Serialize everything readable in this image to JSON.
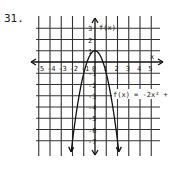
{
  "problem_number": "31.",
  "chart_data": {
    "type": "line",
    "title": "",
    "function_label": "f(x) = -2x² + 1",
    "xlabel": "x",
    "ylabel": "f(x)",
    "xlim": [
      -5,
      5
    ],
    "ylim": [
      -7,
      3
    ],
    "grid": true,
    "x_ticks": [
      "-5",
      "-4",
      "-3",
      "-2",
      "-1",
      "0",
      "1",
      "2",
      "3",
      "4",
      "5"
    ],
    "y_ticks": [
      "3",
      "2",
      "1",
      "-1",
      "-2",
      "-3",
      "-4",
      "-5",
      "-6",
      "-7"
    ],
    "series": [
      {
        "name": "f(x) = -2x² + 1",
        "x": [
          -2.1,
          -2,
          -1.5,
          -1,
          -0.5,
          0,
          0.5,
          1,
          1.5,
          2,
          2.1
        ],
        "y": [
          -7.82,
          -7,
          -3.5,
          -1,
          0.5,
          1,
          0.5,
          -1,
          -3.5,
          -7,
          -7.82
        ]
      }
    ]
  }
}
